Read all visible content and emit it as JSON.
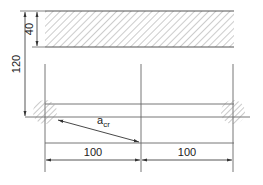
{
  "diagram": {
    "type": "structural-section",
    "colors": {
      "line": "#555555",
      "hatch": "#8a8a8a",
      "text": "#222222"
    },
    "dimensions": {
      "overall_height": "120",
      "slab_thickness": "40",
      "spacing_left": "100",
      "spacing_right": "100"
    },
    "labels": {
      "crack_distance": "a",
      "crack_distance_subscript": "cr"
    }
  }
}
